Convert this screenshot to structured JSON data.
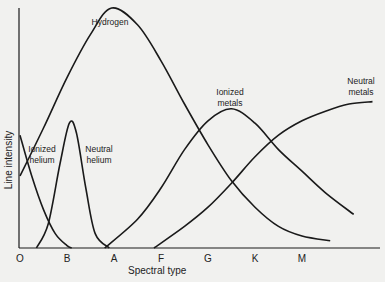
{
  "chart_data": {
    "type": "line",
    "title": "",
    "xlabel": "Spectral type",
    "ylabel": "Line intensity",
    "categories": [
      "O",
      "B",
      "A",
      "F",
      "G",
      "K",
      "M"
    ],
    "xlim": [
      0,
      7.6
    ],
    "ylim": [
      0,
      100
    ],
    "grid": false,
    "legend": "inline labels",
    "series": [
      {
        "name": "Hydrogen",
        "label_lines": [
          "Hydrogen"
        ],
        "x": [
          0,
          0.5,
          1.0,
          1.5,
          1.95,
          2.5,
          3.0,
          3.5,
          4.0,
          4.5,
          5.0,
          5.5,
          6.0,
          6.6
        ],
        "y": [
          30,
          50,
          71,
          89,
          100,
          93,
          78,
          60,
          43,
          28,
          17,
          9,
          5,
          3
        ]
      },
      {
        "name": "Ionized helium",
        "label_lines": [
          "Ionized",
          "helium"
        ],
        "x": [
          0,
          0.25,
          0.5,
          0.75,
          1.0,
          1.1
        ],
        "y": [
          47,
          30,
          16,
          6,
          1,
          0
        ]
      },
      {
        "name": "Neutral helium",
        "label_lines": [
          "Neutral",
          "helium"
        ],
        "x": [
          0.35,
          0.6,
          0.85,
          1.05,
          1.2,
          1.4,
          1.6,
          1.9
        ],
        "y": [
          0,
          10,
          35,
          52,
          48,
          25,
          6,
          0
        ]
      },
      {
        "name": "Ionized metals",
        "label_lines": [
          "Ionized",
          "metals"
        ],
        "x": [
          1.8,
          2.5,
          3.0,
          3.5,
          4.0,
          4.5,
          5.0,
          5.5,
          6.0,
          6.5,
          7.1
        ],
        "y": [
          0,
          12,
          25,
          41,
          53,
          58,
          52,
          41,
          32,
          23,
          14
        ]
      },
      {
        "name": "Neutral metals",
        "label_lines": [
          "Neutral",
          "metals"
        ],
        "x": [
          2.85,
          3.5,
          4.0,
          4.5,
          5.0,
          5.5,
          6.0,
          6.5,
          7.0,
          7.5
        ],
        "y": [
          0,
          9,
          17,
          27,
          38,
          47,
          53,
          57,
          60,
          61
        ]
      }
    ]
  }
}
